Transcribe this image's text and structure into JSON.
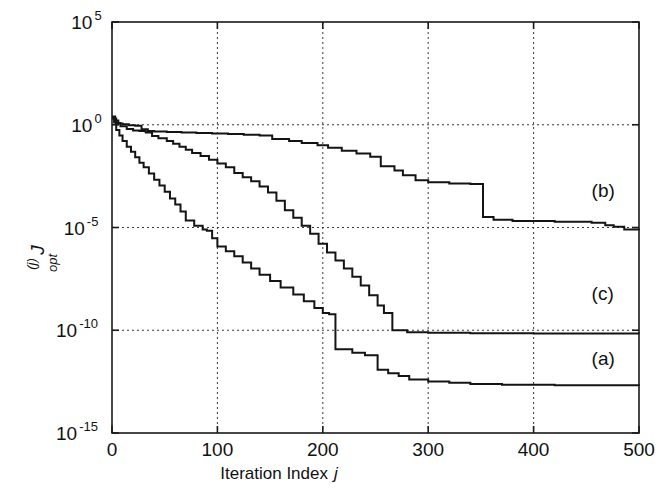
{
  "chart_data": {
    "type": "line",
    "title": "",
    "xlabel": "Iteration Index j",
    "xlabel_text": "Iteration Index",
    "xlabel_italic": "j",
    "ylabel": "J_opt^(j)",
    "ylabel_main": "J",
    "ylabel_sub": "opt",
    "ylabel_sup": "(j)",
    "xlim": [
      0,
      500
    ],
    "ylim": [
      1e-15,
      100000.0
    ],
    "yscale": "log",
    "xscale": "linear",
    "grid": true,
    "grid_axis": "y",
    "legend": "inline-annotations",
    "xticks": [
      0,
      100,
      200,
      300,
      400,
      500
    ],
    "xticklabels": [
      "0",
      "100",
      "200",
      "300",
      "400",
      "500"
    ],
    "yticks": [
      100000.0,
      1.0,
      1e-05,
      1e-10,
      1e-15
    ],
    "yticklabels": [
      "10^5",
      "10^0",
      "10^-5",
      "10^-10",
      "10^-15"
    ],
    "ytick_bases": [
      "10",
      "10",
      "10",
      "10",
      "10"
    ],
    "ytick_exponents": [
      "5",
      "0",
      "-5",
      "-10",
      "-15"
    ],
    "annotations": [
      {
        "label": "(b)",
        "x": 455,
        "y": 0.0003
      },
      {
        "label": "(c)",
        "x": 455,
        "y": 3e-09
      },
      {
        "label": "(a)",
        "x": 455,
        "y": 2e-12
      }
    ],
    "series": [
      {
        "name": "(a)",
        "label": "(a)",
        "color": "#141414",
        "points": [
          [
            0,
            2.2
          ],
          [
            2,
            1.3
          ],
          [
            4,
            0.55
          ],
          [
            7,
            0.3
          ],
          [
            10,
            0.16
          ],
          [
            14,
            0.085
          ],
          [
            18,
            0.048
          ],
          [
            22,
            0.026
          ],
          [
            26,
            0.014
          ],
          [
            30,
            0.0085
          ],
          [
            35,
            0.0042
          ],
          [
            40,
            0.0021
          ],
          [
            45,
            0.0011
          ],
          [
            50,
            0.00055
          ],
          [
            55,
            0.00026
          ],
          [
            60,
            0.00013
          ],
          [
            65,
            6e-05
          ],
          [
            70,
            2.2e-05
          ],
          [
            78,
            1.2e-05
          ],
          [
            86,
            8e-06
          ],
          [
            90,
            7e-06
          ],
          [
            95,
            3e-06
          ],
          [
            100,
            1.2e-06
          ],
          [
            108,
            7e-07
          ],
          [
            116,
            4e-07
          ],
          [
            124,
            2e-07
          ],
          [
            132,
            1e-07
          ],
          [
            140,
            5e-08
          ],
          [
            150,
            2.5e-08
          ],
          [
            160,
            1.2e-08
          ],
          [
            172,
            5.5e-09
          ],
          [
            182,
            2.6e-09
          ],
          [
            192,
            1.2e-09
          ],
          [
            200,
            7e-10
          ],
          [
            206,
            6e-10
          ],
          [
            212,
            1.2e-11
          ],
          [
            228,
            8e-12
          ],
          [
            240,
            6e-12
          ],
          [
            252,
            1.2e-12
          ],
          [
            262,
            8e-13
          ],
          [
            272,
            6e-13
          ],
          [
            282,
            4e-13
          ],
          [
            300,
            3.2e-13
          ],
          [
            320,
            2.8e-13
          ],
          [
            340,
            2.4e-13
          ],
          [
            370,
            2.2e-13
          ],
          [
            420,
            2.1e-13
          ],
          [
            500,
            2e-13
          ]
        ]
      },
      {
        "name": "(b)",
        "label": "(b)",
        "color": "#141414",
        "points": [
          [
            0,
            2.5
          ],
          [
            3,
            1.6
          ],
          [
            6,
            1.15
          ],
          [
            10,
            1.05
          ],
          [
            16,
            0.95
          ],
          [
            22,
            0.9
          ],
          [
            28,
            0.6
          ],
          [
            34,
            0.5
          ],
          [
            40,
            0.47
          ],
          [
            52,
            0.45
          ],
          [
            66,
            0.42
          ],
          [
            80,
            0.4
          ],
          [
            95,
            0.38
          ],
          [
            110,
            0.35
          ],
          [
            125,
            0.33
          ],
          [
            140,
            0.3
          ],
          [
            152,
            0.2
          ],
          [
            168,
            0.16
          ],
          [
            180,
            0.13
          ],
          [
            195,
            0.1
          ],
          [
            205,
            0.075
          ],
          [
            218,
            0.055
          ],
          [
            232,
            0.04
          ],
          [
            245,
            0.028
          ],
          [
            255,
            0.0095
          ],
          [
            268,
            0.006
          ],
          [
            276,
            0.0035
          ],
          [
            288,
            0.002
          ],
          [
            300,
            0.0016
          ],
          [
            320,
            0.0014
          ],
          [
            340,
            0.0013
          ],
          [
            352,
            3.2e-05
          ],
          [
            362,
            2.4e-05
          ],
          [
            380,
            2.1e-05
          ],
          [
            420,
            1.9e-05
          ],
          [
            455,
            1.7e-05
          ],
          [
            468,
            1.3e-05
          ],
          [
            476,
            1.1e-05
          ],
          [
            486,
            8e-06
          ],
          [
            500,
            7.5e-06
          ]
        ]
      },
      {
        "name": "(c)",
        "label": "(c)",
        "color": "#141414",
        "points": [
          [
            0,
            2.0
          ],
          [
            4,
            1.2
          ],
          [
            8,
            0.85
          ],
          [
            14,
            0.62
          ],
          [
            20,
            0.52
          ],
          [
            26,
            0.5
          ],
          [
            32,
            0.42
          ],
          [
            38,
            0.28
          ],
          [
            44,
            0.22
          ],
          [
            52,
            0.16
          ],
          [
            58,
            0.12
          ],
          [
            64,
            0.085
          ],
          [
            70,
            0.06
          ],
          [
            76,
            0.042
          ],
          [
            84,
            0.03
          ],
          [
            92,
            0.02
          ],
          [
            100,
            0.013
          ],
          [
            108,
            0.0085
          ],
          [
            116,
            0.0045
          ],
          [
            124,
            0.0028
          ],
          [
            132,
            0.0018
          ],
          [
            140,
            0.001
          ],
          [
            148,
            0.0005
          ],
          [
            156,
            0.0002
          ],
          [
            164,
            7e-05
          ],
          [
            172,
            3e-05
          ],
          [
            180,
            1.2e-05
          ],
          [
            188,
            5e-06
          ],
          [
            196,
            1.6e-06
          ],
          [
            204,
            6e-07
          ],
          [
            212,
            2.5e-07
          ],
          [
            220,
            1e-07
          ],
          [
            228,
            4e-08
          ],
          [
            236,
            1.5e-08
          ],
          [
            244,
            5e-09
          ],
          [
            252,
            1.6e-09
          ],
          [
            258,
            7e-10
          ],
          [
            266,
            1e-10
          ],
          [
            280,
            8e-11
          ],
          [
            300,
            7.5e-11
          ],
          [
            340,
            7.2e-11
          ],
          [
            400,
            7e-11
          ],
          [
            500,
            6.8e-11
          ]
        ]
      }
    ]
  },
  "layout": {
    "plot_left": 112,
    "plot_right": 639,
    "plot_top": 22,
    "plot_bottom": 433
  }
}
